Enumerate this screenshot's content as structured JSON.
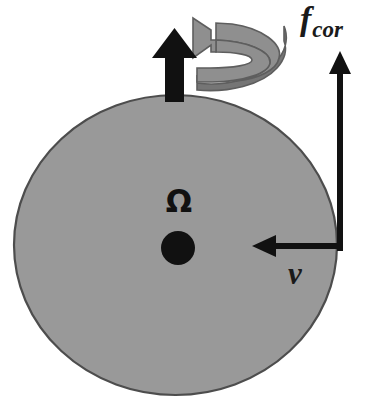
{
  "figure": {
    "background_color": "#ffffff",
    "width": 373,
    "height": 414
  },
  "body": {
    "name": "rotating-sphere",
    "fill_color": "#999999",
    "outline_color": "#4d4d4d",
    "center_x": 175.5,
    "center_y": 245,
    "radius_x": 161.5,
    "radius_y": 150
  },
  "labels": {
    "coriolis_force": "f",
    "coriolis_force_subscript": "cor",
    "velocity": "v",
    "angular_velocity": "Ω"
  },
  "arrows": {
    "rotation_axis": {
      "name": "rotation-axis-arrow",
      "color": "#111111",
      "direction": "up",
      "tip_y": 28,
      "base_y": 100,
      "shaft_x": 174
    },
    "spin_ribbon": {
      "name": "rotation-direction-arrow",
      "color": "#8f8f8f",
      "edge_color": "#5e5e5e",
      "direction": "counterclockwise"
    },
    "coriolis": {
      "name": "coriolis-force-arrow",
      "color": "#111111",
      "direction": "up",
      "x": 340,
      "tip_y": 53,
      "base_y": 250
    },
    "velocity": {
      "name": "velocity-arrow",
      "color": "#111111",
      "direction": "left",
      "y": 246,
      "tip_x": 253,
      "base_x": 340
    }
  },
  "marker": {
    "name": "center-point",
    "color": "#111111",
    "cx": 178,
    "cy": 248,
    "r": 17
  },
  "colors": {
    "sphere_gray": "#999999",
    "ribbon_gray": "#8f8f8f",
    "ink_black": "#111111",
    "page_white": "#ffffff"
  }
}
